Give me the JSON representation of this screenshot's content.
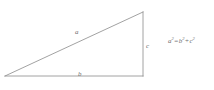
{
  "diagram": {
    "background_color": "#ffffff",
    "stroke_color": "#8a8a8a",
    "text_color": "#6f6f6f",
    "stroke_width": 0.8,
    "width": 214,
    "height": 90,
    "vertices": {
      "left": {
        "x": 5,
        "y": 76
      },
      "top_right": {
        "x": 143,
        "y": 12
      },
      "bottom_right": {
        "x": 143,
        "y": 76
      }
    },
    "sides": [
      {
        "name": "hypotenuse",
        "label": "a",
        "from": "left",
        "to": "top_right"
      },
      {
        "name": "base",
        "label": "b",
        "from": "left",
        "to": "bottom_right"
      },
      {
        "name": "vertical",
        "label": "c",
        "from": "top_right",
        "to": "bottom_right"
      }
    ],
    "labels": {
      "hypotenuse": "a",
      "base": "b",
      "vertical": "c"
    },
    "equation": {
      "full_text": "a2 = b2 + c2",
      "left_base": "a",
      "left_exponent": "2",
      "equals": "=",
      "term1_base": "b",
      "term1_exponent": "2",
      "plus": "+",
      "term2_base": "c",
      "term2_exponent": "2"
    }
  }
}
